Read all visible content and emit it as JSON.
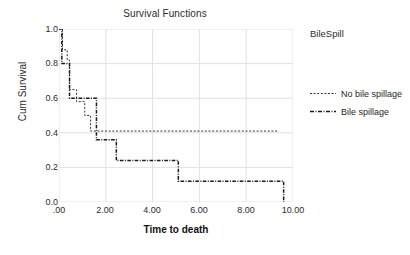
{
  "chart_data": {
    "type": "line",
    "title": "Survival Functions",
    "xlabel": "Time to death",
    "ylabel": "Cum Survival",
    "xlim": [
      0,
      10
    ],
    "ylim": [
      0,
      1
    ],
    "xticks": [
      ".00",
      "2.00",
      "4.00",
      "6.00",
      "8.00",
      "10.00"
    ],
    "xtick_values": [
      0,
      2,
      4,
      6,
      8,
      10
    ],
    "yticks": [
      "0.0",
      "0.2",
      "0.4",
      "0.6",
      "0.8",
      "1.0"
    ],
    "ytick_values": [
      0,
      0.2,
      0.4,
      0.6,
      0.8,
      1.0
    ],
    "grid": true,
    "legend_title": "BileSpill",
    "legend_position": "right",
    "series": [
      {
        "name": "No bile spillage",
        "style": "dotted",
        "color": "#333333",
        "points": [
          [
            0.0,
            1.0
          ],
          [
            0.15,
            1.0
          ],
          [
            0.15,
            0.88
          ],
          [
            0.35,
            0.88
          ],
          [
            0.35,
            0.82
          ],
          [
            0.45,
            0.82
          ],
          [
            0.45,
            0.65
          ],
          [
            0.75,
            0.65
          ],
          [
            0.75,
            0.58
          ],
          [
            1.1,
            0.58
          ],
          [
            1.1,
            0.5
          ],
          [
            1.35,
            0.5
          ],
          [
            1.35,
            0.41
          ],
          [
            9.4,
            0.41
          ]
        ]
      },
      {
        "name": "Bile spillage",
        "style": "dash-dot",
        "color": "#1a1a1a",
        "points": [
          [
            0.0,
            1.0
          ],
          [
            0.12,
            1.0
          ],
          [
            0.12,
            0.8
          ],
          [
            0.45,
            0.8
          ],
          [
            0.45,
            0.6
          ],
          [
            1.6,
            0.6
          ],
          [
            1.6,
            0.36
          ],
          [
            2.45,
            0.36
          ],
          [
            2.45,
            0.24
          ],
          [
            5.1,
            0.24
          ],
          [
            5.1,
            0.12
          ],
          [
            9.6,
            0.12
          ],
          [
            9.6,
            0.0
          ]
        ]
      }
    ]
  }
}
